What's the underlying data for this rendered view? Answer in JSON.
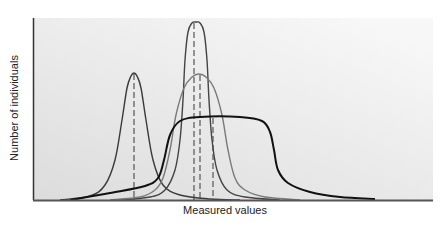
{
  "chart_data": {
    "type": "line",
    "title": "",
    "xlabel": "Measured values",
    "ylabel": "Number of individuals",
    "grid": false,
    "legend": null,
    "ticks": "none",
    "background_gradient": [
      "#f6f6f6",
      "#dedede"
    ],
    "series": [
      {
        "name": "narrow distribution (low mean)",
        "color": "#3a3a3a",
        "stroke_width": 1.4,
        "peak_x_px": 134,
        "peak_y_px": 73,
        "mean_marker_x_px": 134,
        "points": [
          [
            60,
            200
          ],
          [
            90,
            196
          ],
          [
            105,
            185
          ],
          [
            115,
            160
          ],
          [
            122,
            120
          ],
          [
            127,
            88
          ],
          [
            131,
            76
          ],
          [
            134,
            73
          ],
          [
            137,
            76
          ],
          [
            141,
            88
          ],
          [
            146,
            120
          ],
          [
            153,
            160
          ],
          [
            163,
            185
          ],
          [
            180,
            195
          ],
          [
            210,
            199
          ],
          [
            240,
            200
          ]
        ]
      },
      {
        "name": "tall narrow distribution (center)",
        "color": "#444444",
        "stroke_width": 1.4,
        "peak_x_px": 196,
        "peak_y_px": 22,
        "mean_marker_x_px": 194,
        "points": [
          [
            120,
            200
          ],
          [
            150,
            197
          ],
          [
            165,
            190
          ],
          [
            175,
            170
          ],
          [
            180,
            140
          ],
          [
            183,
            100
          ],
          [
            185,
            60
          ],
          [
            188,
            32
          ],
          [
            192,
            23
          ],
          [
            196,
            22
          ],
          [
            200,
            23
          ],
          [
            204,
            32
          ],
          [
            207,
            60
          ],
          [
            209,
            100
          ],
          [
            212,
            140
          ],
          [
            217,
            170
          ],
          [
            227,
            190
          ],
          [
            245,
            197
          ],
          [
            280,
            200
          ]
        ]
      },
      {
        "name": "wide distribution (center)",
        "color": "#7a7a7a",
        "stroke_width": 1.4,
        "peak_x_px": 199,
        "peak_y_px": 74,
        "mean_marker_x_px": 200,
        "points": [
          [
            110,
            200
          ],
          [
            140,
            197
          ],
          [
            155,
            190
          ],
          [
            163,
            178
          ],
          [
            170,
            150
          ],
          [
            176,
            115
          ],
          [
            184,
            88
          ],
          [
            192,
            77
          ],
          [
            199,
            74
          ],
          [
            206,
            77
          ],
          [
            214,
            88
          ],
          [
            222,
            115
          ],
          [
            228,
            150
          ],
          [
            235,
            178
          ],
          [
            245,
            190
          ],
          [
            265,
            197
          ],
          [
            300,
            200
          ]
        ]
      },
      {
        "name": "broad flat distribution",
        "color": "#111111",
        "stroke_width": 2,
        "plateau_y_px": 117,
        "mean_marker_x_px": 213,
        "points": [
          [
            70,
            200
          ],
          [
            110,
            193
          ],
          [
            145,
            186
          ],
          [
            158,
            178
          ],
          [
            164,
            160
          ],
          [
            170,
            135
          ],
          [
            180,
            121
          ],
          [
            200,
            117
          ],
          [
            240,
            117
          ],
          [
            262,
            121
          ],
          [
            270,
            132
          ],
          [
            274,
            150
          ],
          [
            278,
            170
          ],
          [
            288,
            183
          ],
          [
            310,
            192
          ],
          [
            340,
            197
          ],
          [
            375,
            199
          ]
        ]
      }
    ],
    "mean_markers_style": "dashed vertical lines",
    "plot_area_px": {
      "left": 33,
      "top": 18,
      "right": 433,
      "bottom": 200
    }
  }
}
